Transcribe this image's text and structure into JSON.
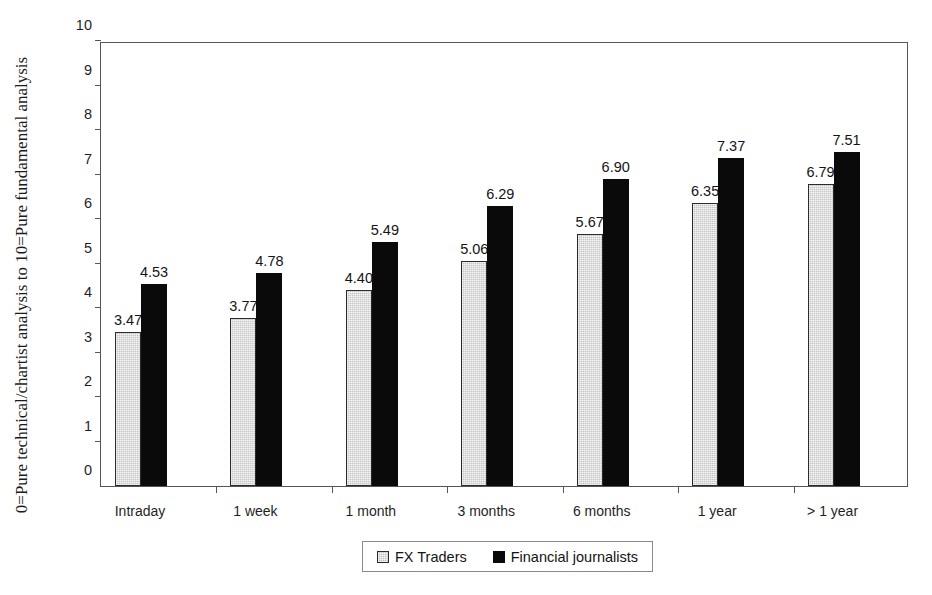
{
  "chart_data": {
    "type": "bar",
    "title": "",
    "subtitle": "",
    "xlabel": "",
    "ylabel": "0=Pure technical/chartist analysis to 10=Pure fundamental analysis",
    "ylim": [
      0,
      10
    ],
    "ytick_labels": [
      "0",
      "1",
      "2",
      "3",
      "4",
      "5",
      "6",
      "7",
      "8",
      "9",
      "10"
    ],
    "ytick_values": [
      0,
      1,
      2,
      3,
      4,
      5,
      6,
      7,
      8,
      9,
      10
    ],
    "grid": false,
    "legend_position": "bottom",
    "categories": [
      "Intraday",
      "1 week",
      "1 month",
      "3 months",
      "6 months",
      "1 year",
      "> 1 year"
    ],
    "series": [
      {
        "name": "FX Traders",
        "color": "#c6c6c6",
        "values": [
          3.47,
          3.77,
          4.4,
          5.06,
          5.67,
          6.35,
          6.79
        ],
        "labels": [
          "3.47",
          "3.77",
          "4.40",
          "5.06",
          "5.67",
          "6.35",
          "6.79"
        ]
      },
      {
        "name": "Financial journalists",
        "color": "#0a0a0a",
        "values": [
          4.53,
          4.78,
          5.49,
          6.29,
          6.9,
          7.37,
          7.51
        ],
        "labels": [
          "4.53",
          "4.78",
          "5.49",
          "6.29",
          "6.90",
          "7.37",
          "7.51"
        ]
      }
    ]
  },
  "legend": {
    "entries": [
      {
        "label": "FX Traders",
        "swatch": "series-0"
      },
      {
        "label": "Financial journalists",
        "swatch": "series-1"
      }
    ]
  }
}
